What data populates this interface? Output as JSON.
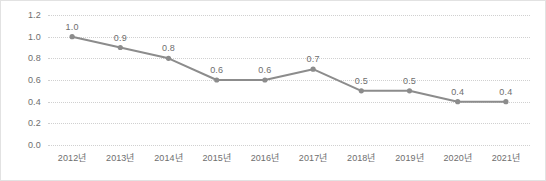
{
  "chart_data": {
    "type": "line",
    "title": "",
    "subtitle": "",
    "xlabel": "",
    "ylabel": "",
    "categories": [
      "2012년",
      "2013년",
      "2014년",
      "2015년",
      "2016년",
      "2017년",
      "2018년",
      "2019년",
      "2020년",
      "2021년"
    ],
    "values": [
      1.0,
      0.9,
      0.8,
      0.6,
      0.6,
      0.7,
      0.5,
      0.5,
      0.4,
      0.4
    ],
    "point_labels": [
      "1.0",
      "0.9",
      "0.8",
      "0.6",
      "0.6",
      "0.7",
      "0.5",
      "0.5",
      "0.4",
      "0.4"
    ],
    "series": [
      {
        "name": "",
        "values": [
          1.0,
          0.9,
          0.8,
          0.6,
          0.6,
          0.7,
          0.5,
          0.5,
          0.4,
          0.4
        ]
      }
    ],
    "ylim": [
      0.0,
      1.2
    ],
    "y_ticks": [
      0.0,
      0.2,
      0.4,
      0.6,
      0.8,
      1.0,
      1.2
    ],
    "y_tick_labels": [
      "0.0",
      "0.2",
      "0.4",
      "0.6",
      "0.8",
      "1.0",
      "1.2"
    ],
    "grid": true,
    "grid_axis": "y",
    "grid_style": "dotted",
    "legend": false,
    "legend_position": "none",
    "marker": "circle",
    "data_labels_shown": true,
    "colors": {
      "line": "#8c8c8c",
      "marker": "#8c8c8c",
      "gridline": "#d0d0d0",
      "tick_text": "#6e6e6e",
      "data_label_text": "#6e6e6e",
      "background": "#ffffff",
      "frame_border": "#e2e2e2"
    }
  }
}
